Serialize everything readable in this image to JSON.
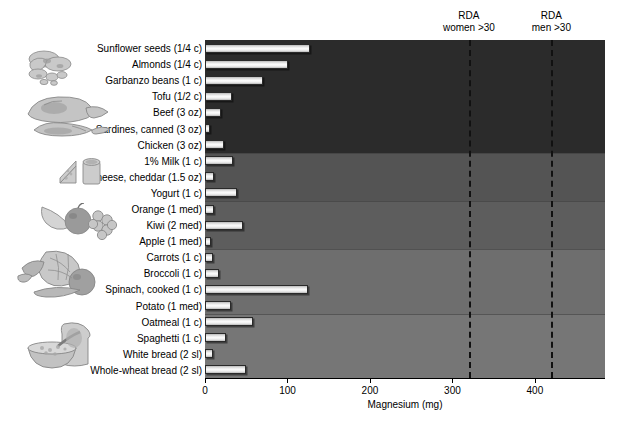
{
  "chart_data": {
    "type": "bar",
    "title": "",
    "xlabel": "Magnesium (mg)",
    "ylabel": "",
    "xlim": [
      0,
      485
    ],
    "orientation": "horizontal",
    "grid": false,
    "legend": "none",
    "xticks": [
      0,
      100,
      200,
      300,
      400
    ],
    "xtick_labels": [
      "0",
      "100",
      "200",
      "300",
      "400"
    ],
    "categories": [
      "Sunflower seeds (1/4 c)",
      "Almonds  (1/4 c)",
      "Garbanzo beans (1 c)",
      "Tofu (1/2 c)",
      "Beef (3 oz)",
      "Sardines, canned (3 oz)",
      "Chicken (3 oz)",
      "1% Milk (1 c)",
      "Cheese, cheddar (1.5 oz)",
      "Yogurt (1 c)",
      "Orange (1 med)",
      "Kiwi (2 med)",
      "Apple (1 med)",
      "Carrots (1 c)",
      "Broccoli (1 c)",
      "Spinach, cooked (1 c)",
      "Potato (1 med)",
      "Oatmeal (1 c)",
      "Spaghetti (1 c)",
      "White bread (2 sl)",
      "Whole-wheat bread (2 sl)"
    ],
    "values": [
      127,
      101,
      70,
      33,
      20,
      6,
      23,
      34,
      11,
      39,
      11,
      46,
      7,
      10,
      17,
      125,
      31,
      58,
      25,
      10,
      50
    ],
    "annotations": [
      {
        "label_line1": "RDA",
        "label_line2": "women >30",
        "value": 320
      },
      {
        "label_line1": "RDA",
        "label_line2": "men >30",
        "value": 420
      }
    ],
    "food_groups": [
      {
        "name": "nuts-seeds-legumes",
        "rows": [
          0,
          2
        ]
      },
      {
        "name": "meat-fish-poultry",
        "rows": [
          3,
          6
        ]
      },
      {
        "name": "dairy",
        "rows": [
          7,
          9
        ]
      },
      {
        "name": "fruits",
        "rows": [
          10,
          12
        ]
      },
      {
        "name": "vegetables",
        "rows": [
          13,
          16
        ]
      },
      {
        "name": "grains",
        "rows": [
          17,
          20
        ]
      }
    ],
    "background_bands": [
      {
        "rows": [
          0,
          6
        ],
        "color": "#2b2b2b"
      },
      {
        "rows": [
          7,
          9
        ],
        "color": "#545454"
      },
      {
        "rows": [
          10,
          12
        ],
        "color": "#5d5d5d"
      },
      {
        "rows": [
          13,
          16
        ],
        "color": "#6e6e6e"
      },
      {
        "rows": [
          17,
          20
        ],
        "color": "#767676"
      }
    ]
  },
  "colors": {
    "bar_fill": "#f2f2f2",
    "bar_edge": "#2a2a2a",
    "rda_line": "#111111",
    "axis": "#000000",
    "page_background": "#ffffff"
  }
}
